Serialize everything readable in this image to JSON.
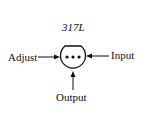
{
  "diagram": {
    "title": "317L",
    "package": "TO-92 (bottom view)",
    "pins": [
      {
        "name": "Adjust",
        "side": "left"
      },
      {
        "name": "Output",
        "side": "bottom"
      },
      {
        "name": "Input",
        "side": "right"
      }
    ],
    "labels": {
      "adjust": "Adjust",
      "input": "Input",
      "output": "Output"
    }
  }
}
